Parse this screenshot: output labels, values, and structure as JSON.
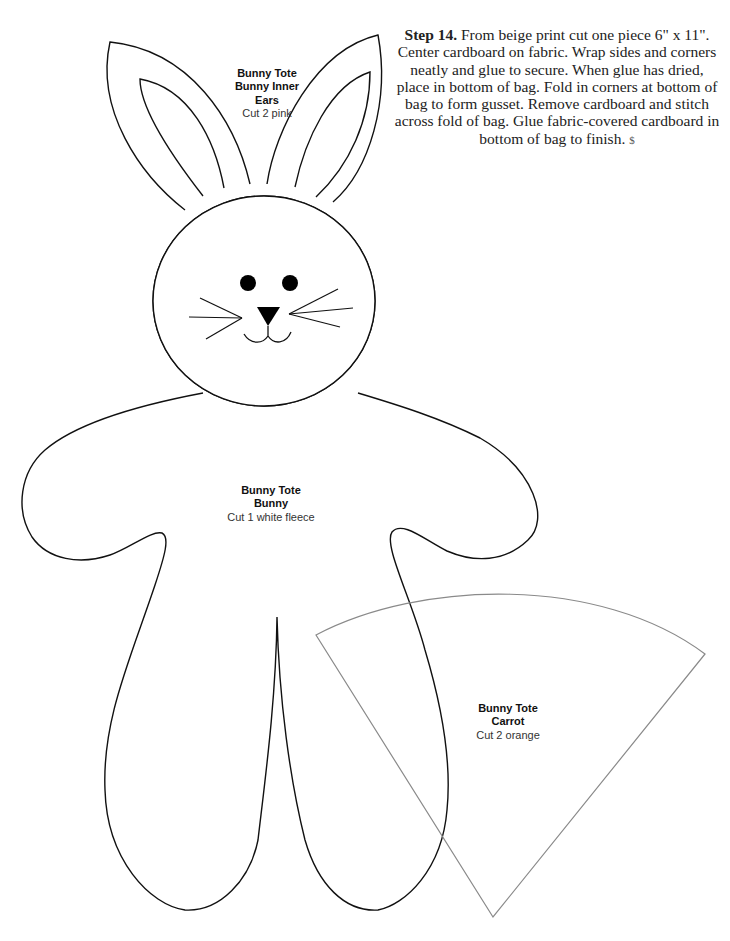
{
  "instructions": {
    "step_label": "Step 14.",
    "step_text": " From beige print cut one piece 6\" x 11\". Center cardboard on fabric. Wrap sides and corners neatly and glue to secure. When glue has dried, place in bottom of bag. Fold in corners at bottom of bag to form gusset. Remove cardboard and stitch across fold of bag. Glue fabric-covered cardboard in bottom of bag to finish.",
    "end_mark": "$"
  },
  "patterns": [
    {
      "name": "inner-ears",
      "title_line1": "Bunny Tote",
      "title_line2": "Bunny Inner",
      "title_line3": "Ears",
      "cut": "Cut 2 pink"
    },
    {
      "name": "bunny-body",
      "title_line1": "Bunny Tote",
      "title_line2": "Bunny",
      "cut": "Cut 1 white fleece"
    },
    {
      "name": "carrot",
      "title_line1": "Bunny Tote",
      "title_line2": "Carrot",
      "cut": "Cut 2 orange"
    }
  ],
  "colors": {
    "outline": "#111111",
    "carrot_outline": "#8a8a8a"
  }
}
